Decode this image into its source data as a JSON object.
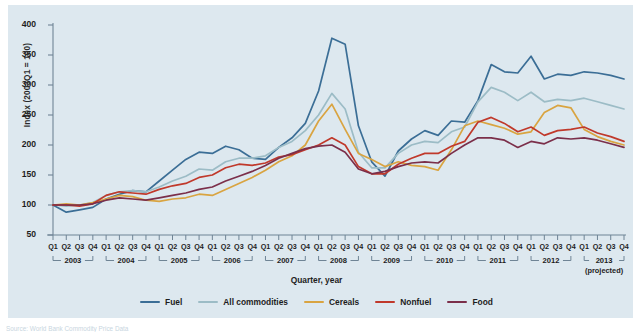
{
  "chart_data": {
    "type": "line",
    "title": "",
    "xlabel": "Quarter, year",
    "ylabel": "Index (2003Q1 = 100)",
    "ylim": [
      50,
      400
    ],
    "ytick_values": [
      50,
      100,
      150,
      200,
      250,
      300,
      350,
      400
    ],
    "grid": false,
    "legend_position": "bottom-center",
    "x_unit": "quarter",
    "years": [
      {
        "year": "2003",
        "quarters": [
          "Q1",
          "Q2",
          "Q3",
          "Q4"
        ],
        "note": ""
      },
      {
        "year": "2004",
        "quarters": [
          "Q1",
          "Q2",
          "Q3",
          "Q4"
        ],
        "note": ""
      },
      {
        "year": "2005",
        "quarters": [
          "Q1",
          "Q2",
          "Q3",
          "Q4"
        ],
        "note": ""
      },
      {
        "year": "2006",
        "quarters": [
          "Q1",
          "Q2",
          "Q3",
          "Q4"
        ],
        "note": ""
      },
      {
        "year": "2007",
        "quarters": [
          "Q1",
          "Q2",
          "Q3",
          "Q4"
        ],
        "note": ""
      },
      {
        "year": "2008",
        "quarters": [
          "Q1",
          "Q2",
          "Q3",
          "Q4"
        ],
        "note": ""
      },
      {
        "year": "2009",
        "quarters": [
          "Q1",
          "Q2",
          "Q3",
          "Q4"
        ],
        "note": ""
      },
      {
        "year": "2010",
        "quarters": [
          "Q1",
          "Q2",
          "Q3",
          "Q4"
        ],
        "note": ""
      },
      {
        "year": "2011",
        "quarters": [
          "Q1",
          "Q2",
          "Q3",
          "Q4"
        ],
        "note": ""
      },
      {
        "year": "2012",
        "quarters": [
          "Q1",
          "Q2",
          "Q3",
          "Q4"
        ],
        "note": ""
      },
      {
        "year": "2013",
        "quarters": [
          "Q1",
          "Q2",
          "Q3",
          "Q4"
        ],
        "note": "(projected)"
      }
    ],
    "x": [
      "2003Q1",
      "2003Q2",
      "2003Q3",
      "2003Q4",
      "2004Q1",
      "2004Q2",
      "2004Q3",
      "2004Q4",
      "2005Q1",
      "2005Q2",
      "2005Q3",
      "2005Q4",
      "2006Q1",
      "2006Q2",
      "2006Q3",
      "2006Q4",
      "2007Q1",
      "2007Q2",
      "2007Q3",
      "2007Q4",
      "2008Q1",
      "2008Q2",
      "2008Q3",
      "2008Q4",
      "2009Q1",
      "2009Q2",
      "2009Q3",
      "2009Q4",
      "2010Q1",
      "2010Q2",
      "2010Q3",
      "2010Q4",
      "2011Q1",
      "2011Q2",
      "2011Q3",
      "2011Q4",
      "2012Q1",
      "2012Q2",
      "2012Q3",
      "2012Q4",
      "2013Q1",
      "2013Q2",
      "2013Q3",
      "2013Q4"
    ],
    "series": [
      {
        "name": "Fuel",
        "color": "#3b6e96",
        "values": [
          100,
          88,
          92,
          96,
          110,
          118,
          124,
          122,
          140,
          158,
          176,
          188,
          186,
          198,
          192,
          178,
          176,
          196,
          212,
          236,
          290,
          378,
          368,
          232,
          172,
          148,
          190,
          210,
          224,
          216,
          240,
          238,
          274,
          334,
          322,
          320,
          348,
          310,
          318,
          316,
          322,
          320,
          316,
          310
        ]
      },
      {
        "name": "All commodities",
        "color": "#9cbcc6",
        "values": [
          100,
          98,
          100,
          104,
          116,
          122,
          124,
          122,
          130,
          140,
          148,
          160,
          158,
          172,
          178,
          178,
          182,
          196,
          206,
          224,
          250,
          286,
          260,
          188,
          162,
          162,
          186,
          200,
          206,
          204,
          222,
          230,
          272,
          296,
          288,
          274,
          288,
          272,
          276,
          274,
          278,
          272,
          266,
          260
        ]
      },
      {
        "name": "Cereals",
        "color": "#d9a441",
        "values": [
          100,
          102,
          100,
          104,
          110,
          116,
          114,
          108,
          106,
          110,
          112,
          118,
          116,
          126,
          136,
          146,
          158,
          172,
          182,
          200,
          240,
          268,
          226,
          186,
          176,
          164,
          172,
          166,
          164,
          158,
          192,
          232,
          240,
          234,
          228,
          218,
          222,
          254,
          266,
          262,
          226,
          214,
          206,
          200
        ]
      },
      {
        "name": "Nonfuel",
        "color": "#c0392b",
        "values": [
          100,
          100,
          98,
          102,
          116,
          122,
          120,
          118,
          126,
          132,
          136,
          146,
          150,
          162,
          168,
          166,
          170,
          180,
          184,
          192,
          200,
          212,
          200,
          164,
          152,
          152,
          168,
          178,
          186,
          186,
          198,
          206,
          238,
          246,
          236,
          222,
          230,
          216,
          224,
          226,
          230,
          220,
          214,
          206
        ]
      },
      {
        "name": "Food",
        "color": "#7b2f4a",
        "values": [
          100,
          100,
          100,
          102,
          108,
          112,
          110,
          108,
          112,
          116,
          120,
          126,
          130,
          140,
          148,
          156,
          166,
          178,
          186,
          194,
          198,
          200,
          188,
          160,
          152,
          156,
          164,
          170,
          172,
          170,
          186,
          200,
          212,
          212,
          208,
          196,
          206,
          202,
          212,
          210,
          212,
          208,
          202,
          196
        ]
      }
    ]
  },
  "axes": {
    "ylabel": "Index (2003Q1 = 100)",
    "xlabel": "Quarter, year",
    "yticks": [
      "400",
      "350",
      "300",
      "250",
      "200",
      "150",
      "100",
      "50"
    ]
  },
  "legend": {
    "items": [
      {
        "label": "Fuel",
        "color": "#3b6e96"
      },
      {
        "label": "All commodities",
        "color": "#9cbcc6"
      },
      {
        "label": "Cereals",
        "color": "#d9a441"
      },
      {
        "label": "Nonfuel",
        "color": "#c0392b"
      },
      {
        "label": "Food",
        "color": "#7b2f4a"
      }
    ]
  },
  "source": {
    "text": "Source: World Bank Commodity Price Data"
  },
  "theme": {
    "panel_background": "#dde8ef",
    "axis_color": "#6f8495",
    "text_color": "#1d1d1d"
  }
}
